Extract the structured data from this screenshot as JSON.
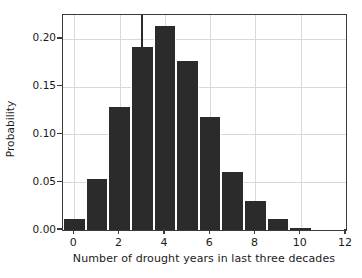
{
  "chart_data": {
    "type": "bar",
    "title": "",
    "xlabel": "Number of drought years in last three decades",
    "ylabel": "Probability",
    "categories": [
      "0",
      "1",
      "2",
      "3",
      "4",
      "5",
      "6",
      "7",
      "8",
      "9",
      "10",
      "11"
    ],
    "values": [
      0.012,
      0.053,
      0.129,
      0.192,
      0.213,
      0.177,
      0.118,
      0.061,
      0.03,
      0.012,
      0.002,
      0.0
    ],
    "xlim": [
      -0.5,
      12
    ],
    "ylim": [
      0,
      0.225
    ],
    "xticks": [
      0,
      2,
      4,
      6,
      8,
      10,
      12
    ],
    "xtick_labels": [
      "0",
      "2",
      "4",
      "6",
      "8",
      "10",
      "12"
    ],
    "yticks": [
      0.0,
      0.05,
      0.1,
      0.15,
      0.2
    ],
    "ytick_labels": [
      "0.00",
      "0.05",
      "0.10",
      "0.15",
      "0.20"
    ],
    "grid": true,
    "legend": "none",
    "bar_color": "#2b2b2b",
    "grid_color": "#d9d9d9",
    "axis_color": "#3a3a3a",
    "background_color": "#ffffff",
    "annotations": [
      {
        "name": "observed-value-marker",
        "type": "vertical-line",
        "x": 3.0,
        "y_top": 0.225,
        "y_bottom": 0.1,
        "color": "#2b2b2b"
      }
    ]
  }
}
